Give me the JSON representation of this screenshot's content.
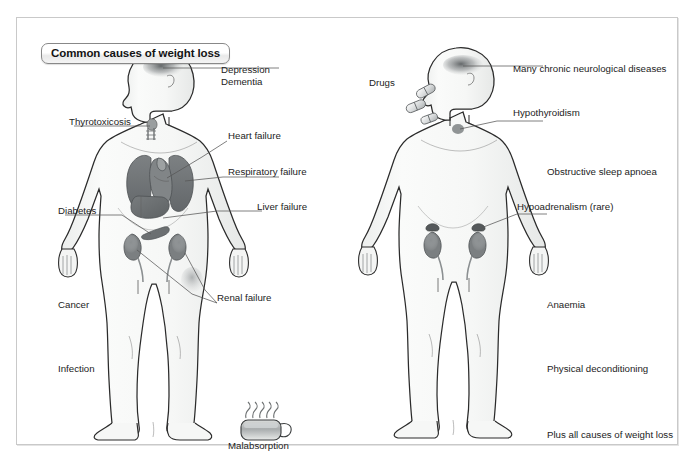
{
  "panels": [
    {
      "id": "weight-loss",
      "title": "Common causes of weight loss",
      "labels": [
        {
          "id": "depression",
          "text": "Depression",
          "leader": true
        },
        {
          "id": "dementia",
          "text": "Dementia",
          "leader": false
        },
        {
          "id": "thyrotoxicosis",
          "text": "Thyrotoxicosis",
          "leader": true
        },
        {
          "id": "heart-failure",
          "text": "Heart failure",
          "leader": true
        },
        {
          "id": "respiratory-failure",
          "text": "Respiratory failure",
          "leader": true
        },
        {
          "id": "liver-failure",
          "text": "Liver failure",
          "leader": true
        },
        {
          "id": "diabetes",
          "text": "Diabetes",
          "leader": true
        },
        {
          "id": "renal-failure",
          "text": "Renal failure",
          "leader": true
        },
        {
          "id": "cancer",
          "text": "Cancer",
          "leader": false
        },
        {
          "id": "infection",
          "text": "Infection",
          "leader": false
        },
        {
          "id": "malabsorption",
          "text": "Malabsorption",
          "leader": false
        }
      ],
      "icons": [
        "steaming-mug-icon"
      ],
      "organs": [
        "brain-shaded",
        "thyroid-gland",
        "lungs",
        "heart",
        "liver",
        "pancreas",
        "kidneys",
        "ureters"
      ]
    },
    {
      "id": "fatigue",
      "title": "Common organic conditions causing fatigue",
      "labels": [
        {
          "id": "drugs",
          "text": "Drugs",
          "leader": false
        },
        {
          "id": "many-chronic-neurological-diseases",
          "text": "Many chronic neurological diseases",
          "leader": true
        },
        {
          "id": "hypothyroidism",
          "text": "Hypothyroidism",
          "leader": true
        },
        {
          "id": "obstructive-sleep-apnoea",
          "text": "Obstructive sleep apnoea",
          "leader": false
        },
        {
          "id": "hypoadrenalism",
          "text": "Hypoadrenalism (rare)",
          "leader": true
        },
        {
          "id": "anaemia",
          "text": "Anaemia",
          "leader": false
        },
        {
          "id": "physical-deconditioning",
          "text": "Physical deconditioning",
          "leader": false
        },
        {
          "id": "plus-all-causes-of-weight-loss",
          "text": "Plus all causes of weight loss",
          "leader": false
        }
      ],
      "icons": [
        "pill-capsule-icon"
      ],
      "organs": [
        "brain-shaded",
        "thyroid-spot",
        "kidneys",
        "adrenal-glands",
        "ureters"
      ]
    }
  ],
  "colors": {
    "frame_border": "#c9c9c9",
    "body_outline": "#2b2b2b",
    "body_fill": "#f7f8f7",
    "organ_dark": "#6e7273",
    "organ_mid": "#8d9193",
    "organ_light": "#b8bcbd",
    "brain_shadow": "#6a6e70",
    "text": "#1c1c1c",
    "leader_line": "#555555",
    "title_border": "#888888"
  }
}
